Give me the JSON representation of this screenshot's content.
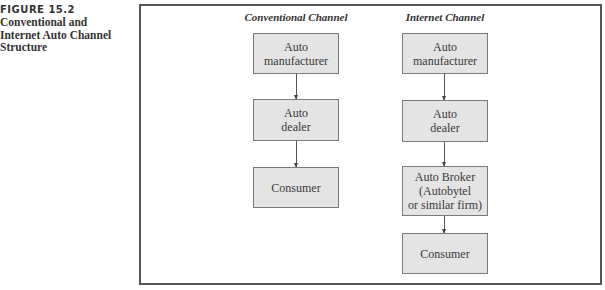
{
  "caption": {
    "label": "FIGURE 15.2",
    "title_lines": [
      "Conventional and",
      "Internet Auto Channel",
      "Structure"
    ]
  },
  "channels": [
    {
      "title": "Conventional Channel",
      "steps": [
        {
          "lines": [
            "Auto",
            "manufacturer"
          ]
        },
        {
          "lines": [
            "Auto",
            "dealer"
          ]
        },
        {
          "lines": [
            "Consumer"
          ]
        }
      ]
    },
    {
      "title": "Internet Channel",
      "steps": [
        {
          "lines": [
            "Auto",
            "manufacturer"
          ]
        },
        {
          "lines": [
            "Auto",
            "dealer"
          ]
        },
        {
          "lines": [
            "Auto Broker",
            "(Autobytel",
            "or similar firm)"
          ]
        },
        {
          "lines": [
            "Consumer"
          ]
        }
      ]
    }
  ],
  "colors": {
    "box_fill": "#e4e4e4",
    "box_border": "#7a7a7a",
    "frame_border": "#555555",
    "text": "#333333"
  }
}
